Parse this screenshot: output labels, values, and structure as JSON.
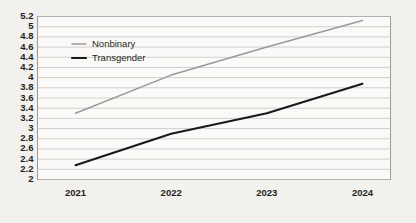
{
  "chart_data": {
    "type": "line",
    "title": "",
    "subtitle": "",
    "xlabel": "",
    "ylabel": "",
    "categories": [
      "2021",
      "2022",
      "2023",
      "2024"
    ],
    "x": [
      2021,
      2022,
      2023,
      2024
    ],
    "series": [
      {
        "name": "Nonbinary",
        "color": "#9a9a9a",
        "values": [
          3.3,
          4.05,
          4.6,
          5.12
        ]
      },
      {
        "name": "Transgender",
        "color": "#1a1a1a",
        "values": [
          2.28,
          2.9,
          3.3,
          3.88
        ]
      }
    ],
    "ylim": [
      2,
      5.2
    ],
    "ytick_step": 0.2,
    "ytick_labels": [
      "5.2",
      "5",
      "4.8",
      "4.6",
      "4.4",
      "4.2",
      "4",
      "3.8",
      "3.6",
      "3.4",
      "3.2",
      "3",
      "2.8",
      "2.6",
      "2.4",
      "2.2",
      "2"
    ],
    "ytick_values": [
      5.2,
      5.0,
      4.8,
      4.6,
      4.4,
      4.2,
      4.0,
      3.8,
      3.6,
      3.4,
      3.2,
      3.0,
      2.8,
      2.6,
      2.4,
      2.2,
      2.0
    ],
    "grid": {
      "horizontal": true,
      "vertical": false,
      "color": "#bfbdba"
    },
    "legend": {
      "position": "inside-top-left",
      "entries": [
        {
          "label": "Nonbinary",
          "color": "#9a9a9a"
        },
        {
          "label": "Transgender",
          "color": "#1a1a1a"
        }
      ]
    },
    "plot_background": "#fbfaf8",
    "border_color": "#9c9a97"
  }
}
